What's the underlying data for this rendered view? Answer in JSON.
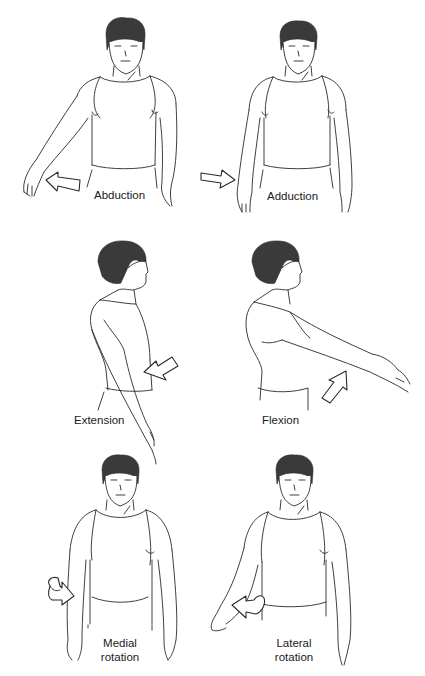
{
  "figure": {
    "panels": [
      {
        "id": "abduction",
        "label_lines": [
          "Abduction"
        ],
        "arrow": "open-arrow-pointing-left",
        "view": "front"
      },
      {
        "id": "adduction",
        "label_lines": [
          "Adduction"
        ],
        "arrow": "open-arrow-pointing-right",
        "view": "front"
      },
      {
        "id": "extension",
        "label_lines": [
          "Extension"
        ],
        "arrow": "open-arrow-pointing-left",
        "view": "side"
      },
      {
        "id": "flexion",
        "label_lines": [
          "Flexion"
        ],
        "arrow": "open-arrow-pointing-up-right",
        "view": "side"
      },
      {
        "id": "medial-rotation",
        "label_lines": [
          "Medial",
          "rotation"
        ],
        "arrow": "curved-rotation-arrow-right",
        "view": "front"
      },
      {
        "id": "lateral-rotation",
        "label_lines": [
          "Lateral",
          "rotation"
        ],
        "arrow": "curved-rotation-arrow-left",
        "view": "front"
      }
    ]
  },
  "colors": {
    "line": "#2a2a2a",
    "hair": "#3a3a3a",
    "background": "#ffffff"
  }
}
